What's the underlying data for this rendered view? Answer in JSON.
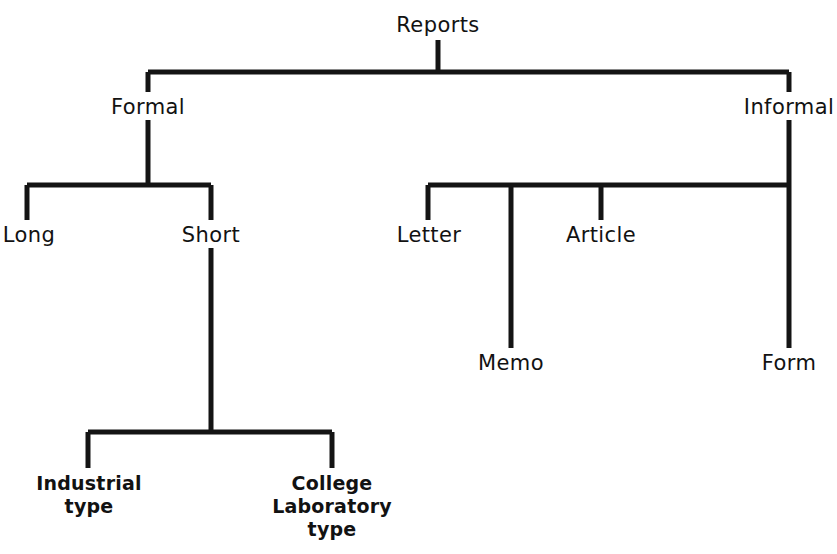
{
  "diagram": {
    "title": "Reports",
    "type": "hierarchy-tree",
    "orientation": "top-down",
    "background_color": "#ffffff",
    "line_color": "#141414",
    "text_color": "#121212",
    "canvas": {
      "width": 832,
      "height": 554
    }
  },
  "nodes": [
    {
      "id": "reports",
      "label": "Reports",
      "level": 0,
      "x": 438,
      "y": 14,
      "multiline": false,
      "parent": null
    },
    {
      "id": "formal",
      "label": "Formal",
      "level": 1,
      "x": 148,
      "y": 96,
      "multiline": false,
      "parent": "reports"
    },
    {
      "id": "informal",
      "label": "Informal",
      "level": 1,
      "x": 789,
      "y": 96,
      "multiline": false,
      "parent": "reports"
    },
    {
      "id": "long",
      "label": "Long",
      "level": 2,
      "x": 29,
      "y": 224,
      "multiline": false,
      "parent": "formal"
    },
    {
      "id": "short",
      "label": "Short",
      "level": 2,
      "x": 211,
      "y": 224,
      "multiline": false,
      "parent": "formal"
    },
    {
      "id": "letter",
      "label": "Letter",
      "level": 2,
      "x": 429,
      "y": 224,
      "multiline": false,
      "parent": "informal"
    },
    {
      "id": "article",
      "label": "Article",
      "level": 2,
      "x": 601,
      "y": 224,
      "multiline": false,
      "parent": "informal"
    },
    {
      "id": "memo",
      "label": "Memo",
      "level": 2,
      "x": 511,
      "y": 352,
      "multiline": false,
      "parent": "informal"
    },
    {
      "id": "form",
      "label": "Form",
      "level": 2,
      "x": 789,
      "y": 352,
      "multiline": false,
      "parent": "informal"
    },
    {
      "id": "industrial",
      "label": "Industrial\ntype",
      "level": 3,
      "x": 89,
      "y": 472,
      "multiline": true,
      "parent": "short"
    },
    {
      "id": "college",
      "label": "College\nLaboratory\ntype",
      "level": 3,
      "x": 332,
      "y": 472,
      "multiline": true,
      "parent": "short"
    }
  ],
  "connectors": [
    {
      "name": "reports-stem",
      "d": "M 438 40 L 438 72"
    },
    {
      "name": "level1-bus",
      "d": "M 148 72 L 789 72"
    },
    {
      "name": "formal-riser",
      "d": "M 148 72 L 148 92"
    },
    {
      "name": "informal-riser",
      "d": "M 789 72 L 789 92"
    },
    {
      "name": "formal-stem",
      "d": "M 148 120 L 148 185"
    },
    {
      "name": "formal-bus",
      "d": "M 27 185 L 211 185"
    },
    {
      "name": "long-drop",
      "d": "M 27 185 L 27 220"
    },
    {
      "name": "short-drop",
      "d": "M 211 185 L 211 220"
    },
    {
      "name": "short-stem",
      "d": "M 211 248 L 211 432"
    },
    {
      "name": "short-bus",
      "d": "M 88 432 L 332 432"
    },
    {
      "name": "industrial-drop",
      "d": "M 88 432 L 88 468"
    },
    {
      "name": "college-drop",
      "d": "M 332 432 L 332 468"
    },
    {
      "name": "informal-stem",
      "d": "M 789 120 L 789 185"
    },
    {
      "name": "informal-bus",
      "d": "M 428 185 L 789 185"
    },
    {
      "name": "letter-drop",
      "d": "M 428 185 L 428 220"
    },
    {
      "name": "article-drop",
      "d": "M 601 185 L 601 220"
    },
    {
      "name": "memo-drop",
      "d": "M 511 185 L 511 348"
    },
    {
      "name": "form-drop",
      "d": "M 789 185 L 789 348"
    }
  ]
}
